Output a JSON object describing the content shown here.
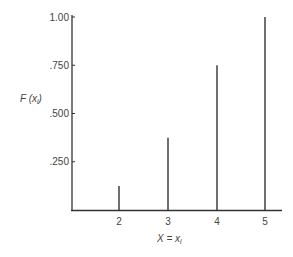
{
  "chart_data": {
    "type": "bar",
    "subtype": "stem",
    "title": "",
    "xlabel": "X = x_i",
    "ylabel": "F(x_i)",
    "categories": [
      "2",
      "3",
      "4",
      "5"
    ],
    "values": [
      0.125,
      0.375,
      0.75,
      1.0
    ],
    "x": [
      2,
      3,
      4,
      5
    ],
    "ylim": [
      0,
      1.0
    ],
    "yticks": [
      0.25,
      0.5,
      0.75,
      1.0
    ],
    "ytick_labels": [
      ".250",
      ".500",
      ".750",
      "1.00"
    ],
    "xtick_labels": [
      "2",
      "3",
      "4",
      "5"
    ],
    "grid": false,
    "legend": null
  },
  "labels": {
    "ylabel_main": "F (x",
    "ylabel_sub": "i",
    "ylabel_close": ")",
    "xlabel_main": "X = x",
    "xlabel_sub": "i"
  }
}
